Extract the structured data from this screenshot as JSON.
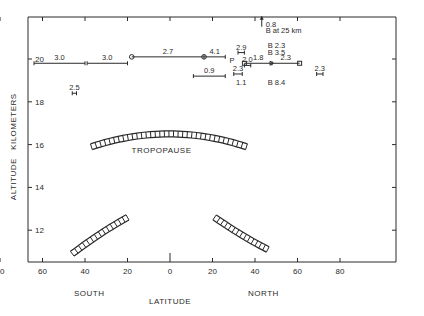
{
  "chart_data": {
    "type": "scatter",
    "title": "",
    "xlabel": "LATITUDE",
    "ylabel": "ALTITUDE   KILOMETERS",
    "xlim": [
      -90,
      90
    ],
    "ylim": [
      10,
      22.5
    ],
    "x_ticks": [
      -80,
      -60,
      -40,
      -20,
      0,
      20,
      40,
      60,
      80
    ],
    "x_tick_labels": [
      "80",
      "60",
      "40",
      "20",
      "0",
      "20",
      "40",
      "60",
      "80"
    ],
    "y_ticks": [
      12,
      14,
      16,
      18,
      20
    ],
    "y_tick_labels": [
      "12",
      "14",
      "16",
      "18",
      "20"
    ],
    "hemisphere_labels": {
      "south": "SOUTH",
      "north": "NORTH"
    },
    "grid": false,
    "tropopause_label": "TROPOPAUSE",
    "ranges": [
      {
        "label": "3.0",
        "x1": -64,
        "x2": -40,
        "y": 19.8
      },
      {
        "label": "3.0",
        "x1": -39,
        "x2": -20,
        "y": 19.8
      },
      {
        "label": "2.5",
        "x1": -46,
        "x2": -44,
        "y": 18.4
      },
      {
        "label": "2.7",
        "x1": -18,
        "x2": 16,
        "y": 20.1,
        "start_marker": "circle",
        "end_marker": "circle"
      },
      {
        "label": "4.1",
        "x1": 16,
        "x2": 26,
        "y": 20.1
      },
      {
        "label": "0.9",
        "x1": 11,
        "x2": 26,
        "y": 19.2
      },
      {
        "label": "2.9",
        "x1": 32,
        "x2": 35,
        "y": 20.3
      },
      {
        "label": "2.3",
        "x1": 30,
        "x2": 34,
        "y": 19.3
      },
      {
        "label": "2.0",
        "x1": 35,
        "x2": 38,
        "y": 19.7
      },
      {
        "label": "1.8",
        "x1": 35,
        "x2": 48,
        "y": 19.8,
        "start_marker": "square",
        "end_marker": "triangle"
      },
      {
        "label": "2.3",
        "x1": 48,
        "x2": 61,
        "y": 19.8,
        "end_marker": "square"
      },
      {
        "label": "2.3",
        "x1": 69,
        "x2": 72,
        "y": 19.3
      }
    ],
    "annotations": [
      {
        "text": "0.8",
        "x": 46,
        "y": 21.6,
        "arrow": "up"
      },
      {
        "text": "B at 25 km",
        "x": 45,
        "y": 21.2
      },
      {
        "text": "B 2.3",
        "x": 46,
        "y": 20.5
      },
      {
        "text": "B 3.5",
        "x": 46,
        "y": 20.2
      },
      {
        "text": "1.1",
        "x": 31,
        "y": 18.8
      },
      {
        "text": "B  8.4",
        "x": 46,
        "y": 18.8
      },
      {
        "text": "P",
        "x": 28,
        "y": 19.8
      }
    ],
    "tropopause": {
      "center_arc": {
        "x_from": -37,
        "x_to": 36,
        "y_center": 16.5,
        "y_ends": 15.9
      },
      "south_segment": {
        "x_from": -46,
        "x_to": -20,
        "y_from": 10.9,
        "y_to": 12.6
      },
      "north_segment": {
        "x_from": 21,
        "x_to": 46,
        "y_from": 12.6,
        "y_to": 11.1
      }
    }
  }
}
